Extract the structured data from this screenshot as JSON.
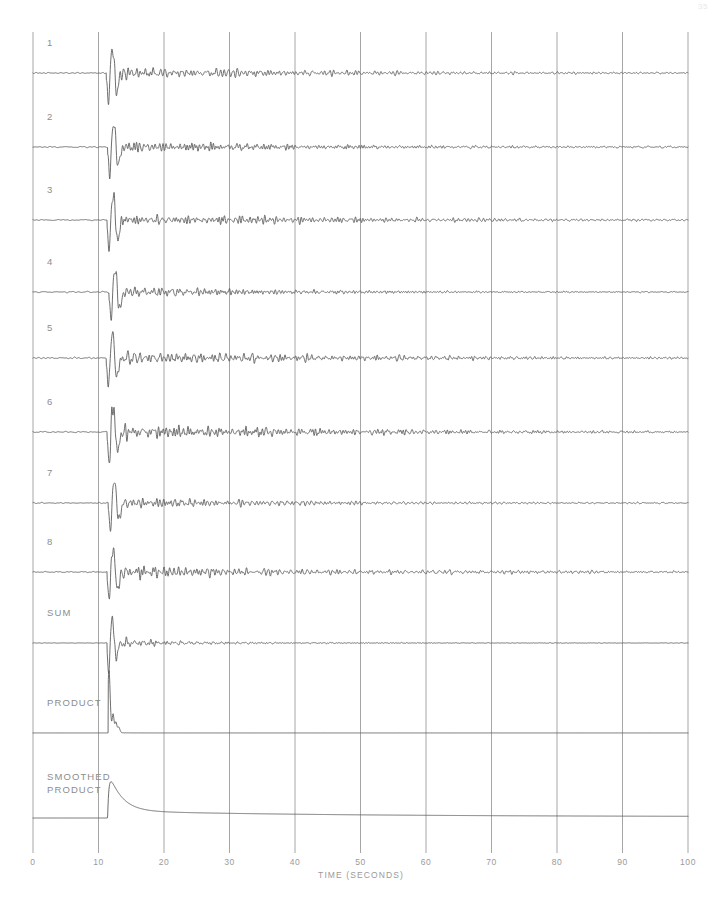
{
  "page_number": "35",
  "chart_data": {
    "type": "line",
    "title": "",
    "xlabel": "TIME (SECONDS)",
    "ylabel": "",
    "xlim": [
      0,
      100
    ],
    "xticks": [
      0,
      10,
      20,
      30,
      40,
      50,
      60,
      70,
      80,
      90,
      100
    ],
    "xticklabels": [
      "0",
      "10",
      "20",
      "30",
      "40",
      "50",
      "60",
      "70",
      "80",
      "90",
      "100"
    ],
    "grid": "vertical-only",
    "legend": "none",
    "colors": {
      "trace": "#5d5d5d",
      "grid": "#a6a6a6",
      "axis": "#a6a6a6",
      "label": "#8d8d8d",
      "background": "#ffffff"
    },
    "annotations": {
      "onset_time": 11.3,
      "peak_time": 12.4,
      "note": "Seismic array record section: eight channels plus sum, product and smoothed product traces. Onset of arrival near t = 11 s with decaying coda."
    },
    "series": [
      {
        "name": "1",
        "label": "1",
        "kind": "seismic",
        "baseline_y": 73,
        "amplitude": 30,
        "onset": 11.2,
        "noise": 1.5,
        "coda_decay": 34,
        "coda_amp": 9.5,
        "spike_amp": 30,
        "seed": 11
      },
      {
        "name": "2",
        "label": "2",
        "kind": "seismic",
        "baseline_y": 147,
        "amplitude": 29,
        "onset": 11.4,
        "noise": 1.4,
        "coda_decay": 36,
        "coda_amp": 9.0,
        "spike_amp": 29,
        "seed": 23
      },
      {
        "name": "3",
        "label": "3",
        "kind": "seismic",
        "baseline_y": 220,
        "amplitude": 31,
        "onset": 11.3,
        "noise": 1.6,
        "coda_decay": 38,
        "coda_amp": 10.0,
        "spike_amp": 31,
        "seed": 37
      },
      {
        "name": "4",
        "label": "4",
        "kind": "seismic",
        "baseline_y": 292,
        "amplitude": 27,
        "onset": 11.6,
        "noise": 1.3,
        "coda_decay": 31,
        "coda_amp": 8.0,
        "spike_amp": 27,
        "seed": 51
      },
      {
        "name": "5",
        "label": "5",
        "kind": "seismic",
        "baseline_y": 358,
        "amplitude": 30,
        "onset": 11.2,
        "noise": 1.6,
        "coda_decay": 40,
        "coda_amp": 10.5,
        "spike_amp": 30,
        "seed": 67
      },
      {
        "name": "6",
        "label": "6",
        "kind": "seismic",
        "baseline_y": 432,
        "amplitude": 31,
        "onset": 11.3,
        "noise": 1.5,
        "coda_decay": 42,
        "coda_amp": 10.5,
        "spike_amp": 31,
        "seed": 83
      },
      {
        "name": "7",
        "label": "7",
        "kind": "seismic",
        "baseline_y": 503,
        "amplitude": 26,
        "onset": 11.5,
        "noise": 1.3,
        "coda_decay": 33,
        "coda_amp": 8.5,
        "spike_amp": 26,
        "seed": 97
      },
      {
        "name": "8",
        "label": "8",
        "kind": "seismic",
        "baseline_y": 572,
        "amplitude": 29,
        "onset": 11.3,
        "noise": 1.5,
        "coda_decay": 44,
        "coda_amp": 10.0,
        "spike_amp": 29,
        "seed": 113
      },
      {
        "name": "SUM",
        "label": "SUM",
        "kind": "sum",
        "baseline_y": 643,
        "amplitude": 30,
        "onset": 11.3,
        "noise": 0.5,
        "coda_decay": 14,
        "coda_amp": 5.5,
        "spike_amp": 30,
        "seed": 131
      },
      {
        "name": "PRODUCT",
        "label": "PRODUCT",
        "kind": "product",
        "baseline_y": 733,
        "amplitude": 62,
        "onset": 11.6,
        "noise": 0.15,
        "coda_decay": 2.0,
        "coda_amp": 1.2,
        "spike_amp": 62,
        "seed": 149
      },
      {
        "name": "SMOOTHED PRODUCT",
        "label": "SMOOTHED\nPRODUCT",
        "kind": "smoothed",
        "baseline_y": 818,
        "amplitude": 44,
        "onset": 11.4,
        "noise": 0.18,
        "coda_decay": 5.5,
        "coda_amp": 3.0,
        "spike_amp": 44,
        "seed": 167
      }
    ]
  },
  "axis": {
    "title": "TIME (SECONDS)",
    "unit": "seconds"
  }
}
